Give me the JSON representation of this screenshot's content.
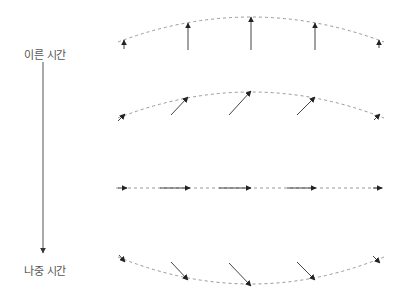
{
  "labels": {
    "early_time": "이른 시간",
    "late_time": "나중 시간"
  },
  "colors": {
    "arrow": "#444444",
    "arrowhead": "#222222",
    "dashed_curve": "#999999",
    "label": "#555555"
  },
  "time_axis": {
    "x": 43,
    "y_start": 62,
    "y_end": 253
  },
  "rows": [
    {
      "name": "row-1-vertical",
      "curve": {
        "x1": 118,
        "y1": 42,
        "cx": 251,
        "cy": -8,
        "x2": 384,
        "y2": 42
      },
      "arrows": [
        {
          "x1": 124,
          "y1": 49,
          "x2": 124,
          "y2": 40
        },
        {
          "x1": 188,
          "y1": 50,
          "x2": 188,
          "y2": 23
        },
        {
          "x1": 251,
          "y1": 50,
          "x2": 251,
          "y2": 17
        },
        {
          "x1": 315,
          "y1": 50,
          "x2": 315,
          "y2": 23
        },
        {
          "x1": 379,
          "y1": 48,
          "x2": 379,
          "y2": 40
        }
      ]
    },
    {
      "name": "row-2-diagonal-up",
      "curve": {
        "x1": 118,
        "y1": 118,
        "cx": 251,
        "cy": 66,
        "x2": 384,
        "y2": 118
      },
      "arrows": [
        {
          "x1": 118,
          "y1": 121,
          "x2": 125,
          "y2": 114
        },
        {
          "x1": 171,
          "y1": 115,
          "x2": 188,
          "y2": 97
        },
        {
          "x1": 229,
          "y1": 115,
          "x2": 251,
          "y2": 91
        },
        {
          "x1": 297,
          "y1": 115,
          "x2": 315,
          "y2": 97
        },
        {
          "x1": 374,
          "y1": 120,
          "x2": 380,
          "y2": 114
        }
      ]
    },
    {
      "name": "row-3-horizontal",
      "curve": {
        "x1": 116,
        "y1": 188,
        "cx": 251,
        "cy": 188,
        "x2": 386,
        "y2": 188
      },
      "arrows": [
        {
          "x1": 118,
          "y1": 188,
          "x2": 127,
          "y2": 188
        },
        {
          "x1": 160,
          "y1": 188,
          "x2": 190,
          "y2": 188
        },
        {
          "x1": 219,
          "y1": 188,
          "x2": 251,
          "y2": 188
        },
        {
          "x1": 287,
          "y1": 188,
          "x2": 316,
          "y2": 188
        },
        {
          "x1": 373,
          "y1": 188,
          "x2": 382,
          "y2": 188
        }
      ]
    },
    {
      "name": "row-4-diagonal-down",
      "curve": {
        "x1": 118,
        "y1": 257,
        "cx": 251,
        "cy": 311,
        "x2": 384,
        "y2": 257
      },
      "arrows": [
        {
          "x1": 119,
          "y1": 255,
          "x2": 125,
          "y2": 262
        },
        {
          "x1": 171,
          "y1": 262,
          "x2": 188,
          "y2": 280
        },
        {
          "x1": 229,
          "y1": 263,
          "x2": 251,
          "y2": 286
        },
        {
          "x1": 297,
          "y1": 262,
          "x2": 315,
          "y2": 280
        },
        {
          "x1": 373,
          "y1": 256,
          "x2": 380,
          "y2": 263
        }
      ]
    }
  ]
}
